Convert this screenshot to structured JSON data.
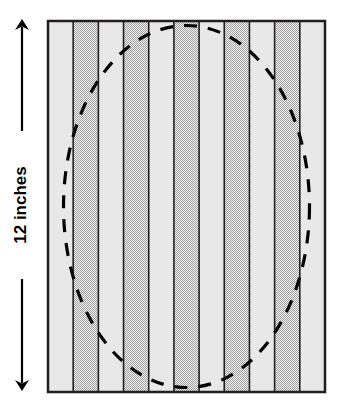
{
  "figure": {
    "dimension_label": "12 inches",
    "colors": {
      "background": "#ffffff",
      "stripe_light": "#e8e8e8",
      "stripe_dark_checker_a": "#a6a6a6",
      "stripe_dark_checker_b": "#efefef",
      "border": "#231f20",
      "dashed_ellipse": "#000000",
      "arrow": "#000000"
    },
    "rectangle": {
      "x": 48,
      "y": 21,
      "width": 277,
      "height": 371,
      "border_width": 2.5
    },
    "stripes": {
      "count": 11,
      "width": 25.18,
      "order": [
        "light",
        "dark",
        "light",
        "dark",
        "light",
        "dark",
        "light",
        "dark",
        "light",
        "dark",
        "light"
      ],
      "divider_width": 1.6
    },
    "ellipse": {
      "cx": 186.5,
      "cy": 206.5,
      "rx": 123,
      "ry": 181,
      "stroke_width": 3.2,
      "dash_pattern": "13 11"
    },
    "dimension_arrow": {
      "x": 22,
      "y_top": 20,
      "y_bottom": 390,
      "stroke_width": 2.2,
      "head_size": 7,
      "label_rotation_deg": -90,
      "label_gap_top": 152,
      "label_gap_bottom": 152
    }
  },
  "chart_data": {
    "type": "diagram",
    "annotations": [
      "12 inches"
    ],
    "shapes": [
      {
        "kind": "rectangle",
        "label": "12 inches tall",
        "stripes": 11
      },
      {
        "kind": "ellipse",
        "label": "dashed inscribed ellipse"
      },
      {
        "kind": "dimension-arrow",
        "label": "12 inches",
        "orientation": "vertical"
      }
    ]
  }
}
